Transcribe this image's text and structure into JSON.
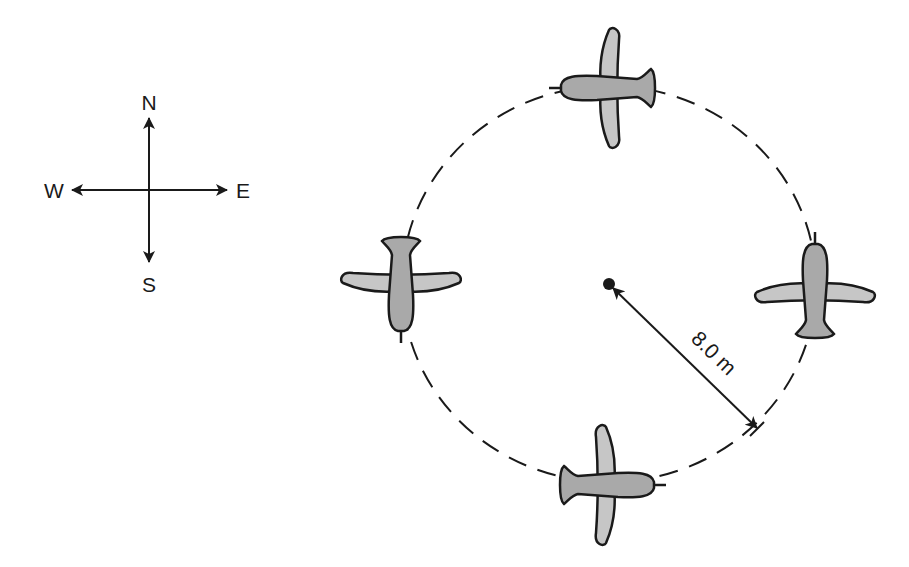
{
  "compass": {
    "north": "N",
    "south": "S",
    "east": "E",
    "west": "W"
  },
  "diagram": {
    "radius_label": "8.0 m",
    "airplane_count": 4,
    "path_style": "dashed circle",
    "colors": {
      "line": "#1a1a1a",
      "fuselage": "#a9a9a9",
      "wing": "#c6c6c6",
      "background": "#ffffff"
    }
  },
  "airplanes": [
    {
      "position": "top",
      "heading": "west"
    },
    {
      "position": "left",
      "heading": "south"
    },
    {
      "position": "bottom",
      "heading": "east"
    },
    {
      "position": "right",
      "heading": "north"
    }
  ]
}
